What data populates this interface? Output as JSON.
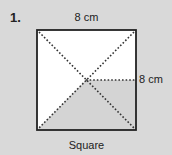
{
  "problem": {
    "number": "1.",
    "top_dimension": "8 cm",
    "right_dimension": "8 cm",
    "shape_name": "Square"
  },
  "colors": {
    "background": "#d9d9d9",
    "square_fill": "#ffffff",
    "shaded_fill": "#d4d4d4",
    "outline": "#222222",
    "dots": "#333333"
  }
}
